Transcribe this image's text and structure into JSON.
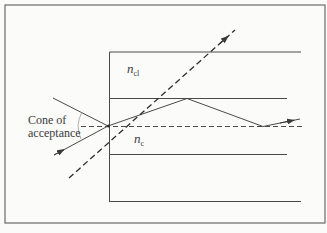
{
  "figure": {
    "type": "optical-fiber-acceptance-cone",
    "labels": {
      "cone_line1": "Cone of",
      "cone_line2": "acceptance",
      "cladding_symbol": "n",
      "cladding_subscript": "cl",
      "core_symbol": "n",
      "core_subscript": "c"
    },
    "colors": {
      "line": "#4a4a4a",
      "frame": "#6a6a6a",
      "background": "#fbfbfa"
    },
    "elements": [
      "outer frame",
      "fiber end face",
      "cladding top boundary",
      "core-cladding boundaries",
      "fiber axis (dashed)",
      "ray at critical angle reflected in core",
      "ray outside cone escaping through cladding (dashed)",
      "cone of acceptance angle arc"
    ]
  }
}
